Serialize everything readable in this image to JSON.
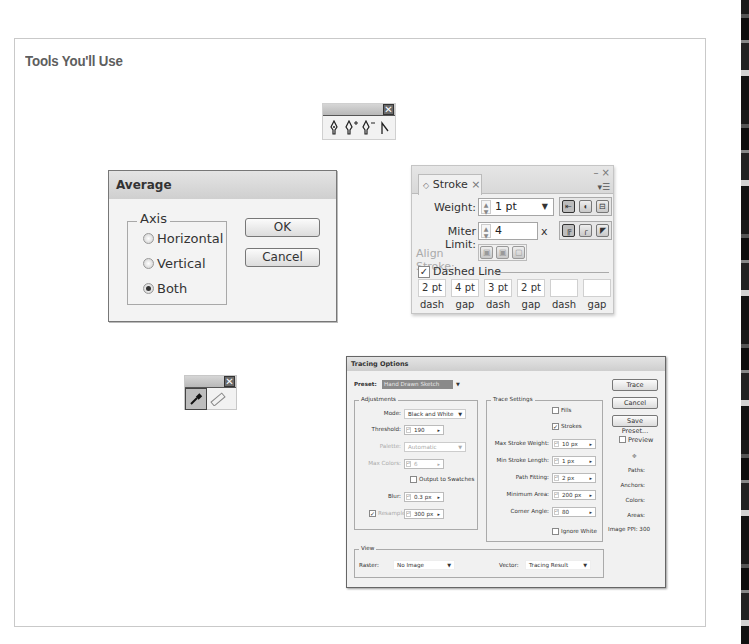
{
  "page": {
    "section_title": "Tools You'll Use"
  },
  "pen_toolbar": {
    "close_glyph": "✕",
    "tools": [
      {
        "name": "pen-tool",
        "glyph": "✒"
      },
      {
        "name": "add-anchor-point-tool",
        "glyph": "✒+"
      },
      {
        "name": "delete-anchor-point-tool",
        "glyph": "✒−"
      },
      {
        "name": "convert-anchor-point-tool",
        "glyph": "⌐"
      }
    ]
  },
  "average_dialog": {
    "title": "Average",
    "group_label": "Axis",
    "options": [
      {
        "label": "Horizontal",
        "selected": false
      },
      {
        "label": "Vertical",
        "selected": false
      },
      {
        "label": "Both",
        "selected": true
      }
    ],
    "ok_label": "OK",
    "cancel_label": "Cancel"
  },
  "stroke_panel": {
    "tab_label": "Stroke",
    "tab_close": "×",
    "window_controls": "– ×",
    "menu_glyph": "▾☰",
    "weight_label": "Weight:",
    "weight_value": "1 pt",
    "miter_label": "Miter Limit:",
    "miter_value": "4",
    "miter_unit": "x",
    "align_label": "Align Stroke:",
    "dashed_label": "Dashed Line",
    "dashed_checked": true,
    "dash_values": [
      "2 pt",
      "4 pt",
      "3 pt",
      "2 pt",
      "",
      ""
    ],
    "dash_labels": [
      "dash",
      "gap",
      "dash",
      "gap",
      "dash",
      "gap"
    ]
  },
  "eyedropper_toolbar": {
    "close_glyph": "✕",
    "tools": [
      {
        "name": "eyedropper-tool",
        "glyph": "✎",
        "selected": true
      },
      {
        "name": "measure-tool",
        "glyph": "▭",
        "selected": false
      }
    ]
  },
  "tracing_options": {
    "title": "Tracing Options",
    "preset_label": "Preset:",
    "preset_value": "Hand Drawn Sketch",
    "adjustments": {
      "legend": "Adjustments",
      "mode_label": "Mode:",
      "mode_value": "Black and White",
      "threshold_label": "Threshold:",
      "threshold_value": "190",
      "palette_label": "Palette:",
      "palette_value": "Automatic",
      "max_colors_label": "Max Colors:",
      "max_colors_value": "6",
      "output_swatches_label": "Output to Swatches",
      "blur_label": "Blur:",
      "blur_value": "0.3 px",
      "resample_label": "Resample:",
      "resample_value": "300 px"
    },
    "trace_settings": {
      "legend": "Trace Settings",
      "fills_label": "Fills",
      "strokes_label": "Strokes",
      "max_stroke_weight_label": "Max Stroke Weight:",
      "max_stroke_weight_value": "10 px",
      "min_stroke_length_label": "Min Stroke Length:",
      "min_stroke_length_value": "1 px",
      "path_fitting_label": "Path Fitting:",
      "path_fitting_value": "2 px",
      "minimum_area_label": "Minimum Area:",
      "minimum_area_value": "200 px",
      "corner_angle_label": "Corner Angle:",
      "corner_angle_value": "80",
      "ignore_white_label": "Ignore White"
    },
    "view": {
      "legend": "View",
      "raster_label": "Raster:",
      "raster_value": "No Image",
      "vector_label": "Vector:",
      "vector_value": "Tracing Result"
    },
    "buttons": {
      "trace": "Trace",
      "cancel": "Cancel",
      "save_preset": "Save Preset..."
    },
    "preview_label": "Preview",
    "stats": {
      "paths": "Paths:",
      "anchors": "Anchors:",
      "colors": "Colors:",
      "areas": "Areas:",
      "image_ppi": "Image PPI: 300"
    }
  }
}
